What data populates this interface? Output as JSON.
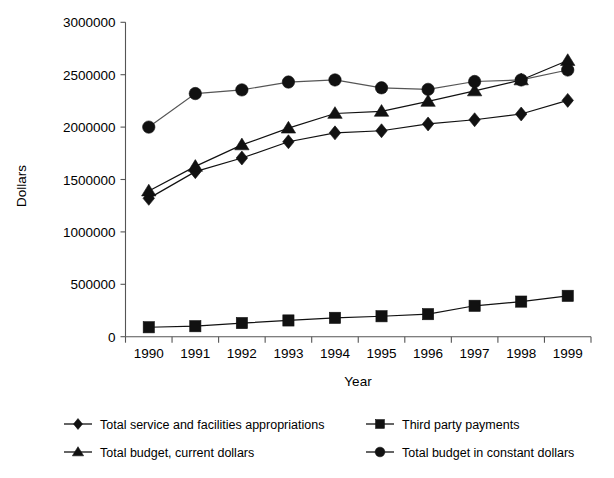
{
  "chart_data": {
    "type": "line",
    "title": "",
    "xlabel": "Year",
    "ylabel": "Dollars",
    "categories": [
      "1990",
      "1991",
      "1992",
      "1993",
      "1994",
      "1995",
      "1996",
      "1997",
      "1998",
      "1999"
    ],
    "ylim": [
      0,
      3000000
    ],
    "yticks": [
      0,
      500000,
      1000000,
      1500000,
      2000000,
      2500000,
      3000000
    ],
    "ytick_labels": [
      "0",
      "500000",
      "1000000",
      "1500000",
      "2000000",
      "2500000",
      "3000000"
    ],
    "grid": false,
    "legend_position": "bottom",
    "series": [
      {
        "name": "Total service and facilities appropriations",
        "marker": "diamond",
        "color": "#111111",
        "values": [
          1320000,
          1575000,
          1705000,
          1860000,
          1945000,
          1965000,
          2030000,
          2070000,
          2125000,
          2255000
        ]
      },
      {
        "name": "Third party payments",
        "marker": "square",
        "color": "#111111",
        "values": [
          90000,
          100000,
          130000,
          155000,
          180000,
          195000,
          215000,
          295000,
          335000,
          390000
        ]
      },
      {
        "name": "Total  budget, current dollars",
        "marker": "triangle",
        "color": "#111111",
        "values": [
          1390000,
          1625000,
          1830000,
          1990000,
          2130000,
          2150000,
          2245000,
          2345000,
          2450000,
          2635000
        ]
      },
      {
        "name": "Total budget in constant dollars",
        "marker": "circle",
        "color": "#111111",
        "values": [
          2000000,
          2320000,
          2355000,
          2430000,
          2450000,
          2375000,
          2360000,
          2435000,
          2450000,
          2545000
        ]
      }
    ]
  },
  "legend": {
    "entries": [
      {
        "label": "Total service and facilities appropriations",
        "marker": "diamond"
      },
      {
        "label": "Third party payments",
        "marker": "square"
      },
      {
        "label": "Total  budget, current dollars",
        "marker": "triangle"
      },
      {
        "label": "Total budget in constant dollars",
        "marker": "circle"
      }
    ]
  }
}
